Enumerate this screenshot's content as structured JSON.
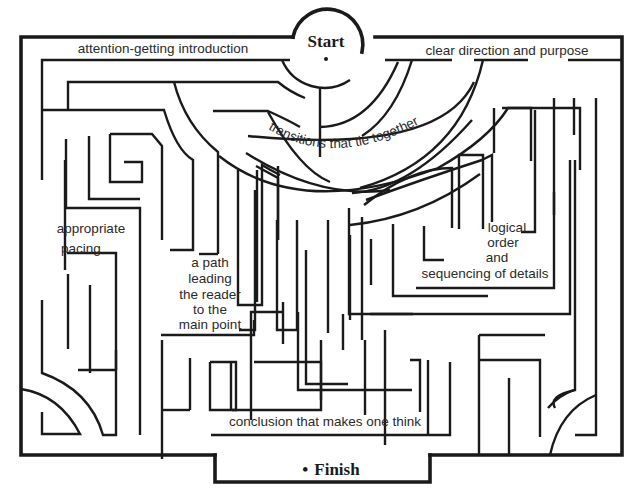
{
  "diagram": {
    "type": "maze",
    "start_label": "Start",
    "finish_label": "Finish",
    "finish_bullet": "•",
    "labels": {
      "intro": "attention-getting introduction",
      "direction": "clear direction and purpose",
      "transitions": "transitions that tie together",
      "pacing_1": "appropriate",
      "pacing_2": "pacing",
      "path_1": "a path",
      "path_2": "leading",
      "path_3": "the reader",
      "path_4": "to the",
      "path_5": "main point",
      "logical_1": "logical",
      "logical_2": "order",
      "logical_3": "and",
      "logical_4": "sequencing of details",
      "conclusion": "conclusion that makes one think"
    }
  }
}
